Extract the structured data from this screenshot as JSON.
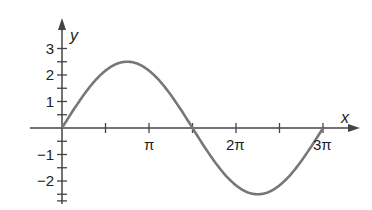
{
  "chart_data": {
    "type": "line",
    "title": "",
    "xlabel": "x",
    "ylabel": "y",
    "function": "y = 2.5 sin(2x/3)",
    "xlim": [
      0,
      9.42
    ],
    "ylim": [
      -2.75,
      3.5
    ],
    "x_ticks": [
      {
        "value": 1.5708,
        "label": ""
      },
      {
        "value": 3.1416,
        "label": "π"
      },
      {
        "value": 4.7124,
        "label": ""
      },
      {
        "value": 6.2832,
        "label": "2π"
      },
      {
        "value": 7.854,
        "label": ""
      },
      {
        "value": 9.4248,
        "label": "3π"
      }
    ],
    "y_ticks": [
      {
        "value": 3,
        "label": "3"
      },
      {
        "value": 2,
        "label": "2"
      },
      {
        "value": 1,
        "label": "1"
      },
      {
        "value": -1,
        "label": "−1"
      },
      {
        "value": -2,
        "label": "−2"
      }
    ],
    "series": [
      {
        "name": "curve",
        "color": "#777777",
        "x": [
          0,
          0.7854,
          1.5708,
          2.3562,
          3.1416,
          3.927,
          4.7124,
          5.4978,
          6.2832,
          7.0686,
          7.854,
          8.6394,
          9.4248
        ],
        "values": [
          0,
          1.25,
          2.165,
          2.5,
          2.165,
          1.25,
          0,
          -1.25,
          -2.165,
          -2.5,
          -2.165,
          -1.25,
          0
        ]
      }
    ],
    "grid": false,
    "legend": "none"
  },
  "axes": {
    "x_name": "x",
    "y_name": "y"
  },
  "colors": {
    "axis": "#444444",
    "curve": "#777777",
    "text": "#222222"
  }
}
